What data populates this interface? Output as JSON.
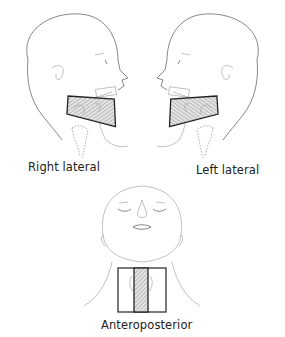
{
  "figure": {
    "views": [
      {
        "id": "right-lateral",
        "label": "Right lateral"
      },
      {
        "id": "left-lateral",
        "label": "Left lateral"
      },
      {
        "id": "anteroposterior",
        "label": "Anteroposterior"
      }
    ]
  }
}
